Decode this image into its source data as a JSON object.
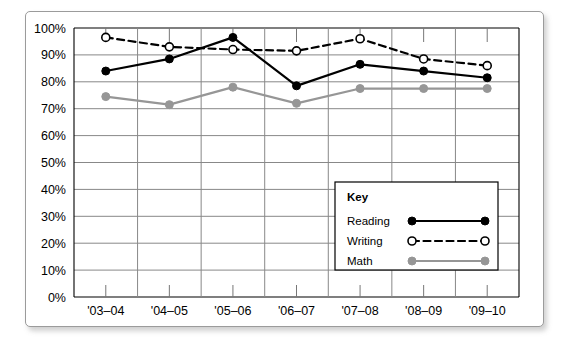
{
  "chart_data": {
    "type": "line",
    "title": "",
    "subtitle": "",
    "xlabel": "",
    "ylabel": "",
    "categories": [
      "'03–04",
      "'04–05",
      "'05–06",
      "'06–07",
      "'07–08",
      "'08–09",
      "'09–10"
    ],
    "ytick_labels": [
      "100%",
      "90%",
      "80%",
      "70%",
      "60%",
      "50%",
      "40%",
      "30%",
      "20%",
      "10%",
      "0%"
    ],
    "ytick_values": [
      100,
      90,
      80,
      70,
      60,
      50,
      40,
      30,
      20,
      10,
      0
    ],
    "ylim": [
      0,
      100
    ],
    "grid": "both",
    "legend_position": "inside-lower-right",
    "series": [
      {
        "name": "Reading",
        "values": [
          84,
          88.5,
          96.5,
          78.5,
          86.5,
          84,
          81.5
        ],
        "color": "#000000",
        "line_style": "solid",
        "marker": "filled-circle"
      },
      {
        "name": "Writing",
        "values": [
          96.5,
          93,
          92,
          91.5,
          96,
          88.5,
          86
        ],
        "color": "#000000",
        "line_style": "dashed",
        "marker": "open-circle"
      },
      {
        "name": "Math",
        "values": [
          74.5,
          71.5,
          78,
          72,
          77.5,
          77.5,
          77.5
        ],
        "color": "#969696",
        "line_style": "solid",
        "marker": "filled-circle"
      }
    ]
  },
  "legend": {
    "title": "Key",
    "entries": [
      {
        "label": "Reading"
      },
      {
        "label": "Writing"
      },
      {
        "label": "Math"
      }
    ]
  },
  "colors": {
    "axis": "#000000",
    "grid": "#888888",
    "reading": "#000000",
    "writing": "#000000",
    "math": "#969696",
    "frame_border": "#9b9b9b"
  }
}
